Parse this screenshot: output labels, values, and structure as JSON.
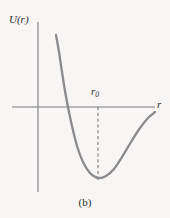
{
  "figure": {
    "caption": "(b)",
    "background_color": "#f7f6f4"
  },
  "labels": {
    "y_axis": "U(r)",
    "x_axis": "r",
    "minimum_marker": "r",
    "minimum_marker_subscript": "0"
  },
  "colors": {
    "axis": "#7d7d82",
    "curve": "#8b8b8f",
    "dashed_guide": "#6f6f73",
    "text": "#2b2b2b"
  },
  "chart_data": {
    "type": "line",
    "title": "",
    "subtitle": "",
    "xlabel": "r",
    "ylabel": "U(r)",
    "grid": false,
    "legend": null,
    "annotations": [
      {
        "text": "r0",
        "kind": "vertical-dashed-guide",
        "x": 98,
        "y_from": 107,
        "y_to": 180,
        "description": "dashed line from r axis down to the potential minimum"
      },
      {
        "text": "(b)",
        "kind": "figure-caption"
      }
    ],
    "axes": {
      "x_axis_y_px": 107,
      "x_axis_x_from_px": 12,
      "x_axis_x_to_px": 155,
      "y_axis_x_px": 38,
      "y_axis_y_from_px": 22,
      "y_axis_y_to_px": 192,
      "origin_px": [
        38,
        107
      ],
      "xlim_label": [
        "0",
        "r"
      ],
      "ylim_label": [
        "",
        "U(r)"
      ]
    },
    "series": [
      {
        "name": "U(r)",
        "description": "Lennard-Jones style interatomic potential: steep repulsive wall at small r, minimum at r0, asymptotic rise toward zero at large r",
        "points_px": [
          [
            56,
            35
          ],
          [
            59,
            52
          ],
          [
            62,
            72
          ],
          [
            65,
            91
          ],
          [
            68,
            107
          ],
          [
            72,
            126
          ],
          [
            77,
            146
          ],
          [
            83,
            162
          ],
          [
            90,
            173
          ],
          [
            98,
            178
          ],
          [
            106,
            176
          ],
          [
            114,
            169
          ],
          [
            122,
            157
          ],
          [
            131,
            142
          ],
          [
            140,
            128
          ],
          [
            148,
            118
          ],
          [
            155,
            112
          ]
        ],
        "zero_crossing_px": [
          68,
          107
        ],
        "minimum_px": [
          98,
          178
        ],
        "start_px": [
          56,
          35
        ],
        "end_px": [
          155,
          112
        ]
      }
    ]
  }
}
